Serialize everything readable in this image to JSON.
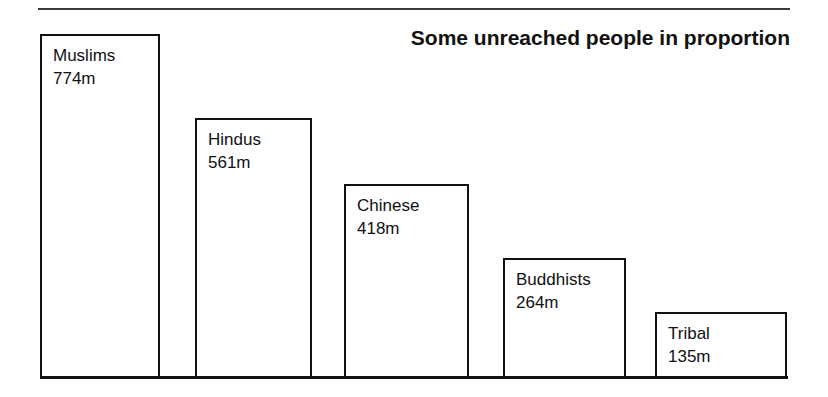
{
  "chart_data": {
    "type": "bar",
    "title": "Some unreached people in proportion",
    "xlabel": "",
    "ylabel": "",
    "categories": [
      "Muslims",
      "Hindus",
      "Chinese",
      "Buddhists",
      "Tribal"
    ],
    "values": [
      774,
      561,
      418,
      264,
      135
    ],
    "value_unit": "m",
    "value_labels": [
      "774m",
      "561m",
      "418m",
      "264m",
      "135m"
    ],
    "ylim": [
      0,
      774
    ],
    "grid": false,
    "legend": "none",
    "orientation": "vertical",
    "style": {
      "bar_fill": "#ffffff",
      "bar_border": "#111111",
      "axis_color": "#111111",
      "text_color": "#111111",
      "background": "#ffffff",
      "rule_color": "#3b3b3b"
    },
    "bars": [
      {
        "name": "Muslims",
        "value": 774,
        "value_label": "774m",
        "left": 40,
        "top": 34,
        "width": 120,
        "height": 343
      },
      {
        "name": "Hindus",
        "value": 561,
        "value_label": "561m",
        "left": 195,
        "top": 118,
        "width": 117,
        "height": 259
      },
      {
        "name": "Chinese",
        "value": 418,
        "value_label": "418m",
        "left": 344,
        "top": 184,
        "width": 125,
        "height": 193
      },
      {
        "name": "Buddhists",
        "value": 264,
        "value_label": "264m",
        "left": 503,
        "top": 258,
        "width": 123,
        "height": 119
      },
      {
        "name": "Tribal",
        "value": 135,
        "value_label": "135m",
        "left": 655,
        "top": 312,
        "width": 132,
        "height": 65
      }
    ]
  }
}
